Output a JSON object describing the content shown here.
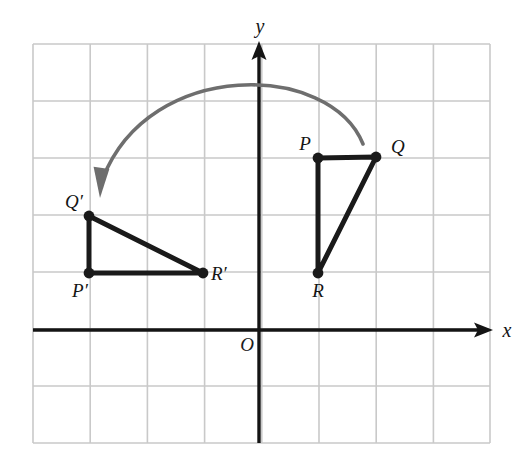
{
  "figure": {
    "background_color": "#ffffff"
  },
  "grid": {
    "color": "#c9c9c9",
    "line_width": 1.6,
    "left": 33,
    "top": 44,
    "right": 490,
    "bottom": 443,
    "cell_width": 57.2,
    "cell_height": 57.0,
    "columns": 8,
    "rows": 7,
    "x_lines": [
      33,
      90.2,
      147.4,
      204.6,
      261.8,
      319,
      376.2,
      433.4,
      490
    ],
    "y_lines": [
      44,
      101,
      158,
      215,
      272,
      329,
      386,
      443
    ]
  },
  "axes": {
    "color": "#141414",
    "line_width": 3.4,
    "origin": {
      "x": 259,
      "y": 330,
      "label": "O",
      "label_x": 247,
      "label_y": 351
    },
    "x_axis": {
      "label": "x",
      "label_x": 507,
      "label_y": 337,
      "y": 330,
      "start_x": 33,
      "end_x": 493,
      "arrow": "right-arrowhead"
    },
    "y_axis": {
      "label": "y",
      "label_x": 260,
      "label_y": 33,
      "x": 259,
      "start_y": 443,
      "end_y": 41,
      "arrow": "up-arrowhead"
    }
  },
  "shapes": {
    "stroke_color": "#1a1a1a",
    "stroke_width": 5,
    "vertex_radius": 5.4,
    "triangles": [
      {
        "name": "triangle-pqr",
        "id": "PQR",
        "vertices": [
          {
            "label": "P",
            "px": 318,
            "py": 158,
            "gx": 1,
            "gy": 3,
            "label_x": 305,
            "label_y": 150,
            "anchor": "middle"
          },
          {
            "label": "Q",
            "px": 376,
            "py": 157,
            "gx": 2,
            "gy": 3,
            "label_x": 391,
            "label_y": 153,
            "anchor": "start"
          },
          {
            "label": "R",
            "px": 318,
            "py": 273,
            "gx": 1,
            "gy": 1,
            "label_x": 318,
            "label_y": 297,
            "anchor": "middle"
          }
        ]
      },
      {
        "name": "triangle-p-prime-q-prime-r-prime",
        "id": "P'Q'R'",
        "vertices": [
          {
            "label": "Q′",
            "px": 89,
            "py": 216,
            "gx": -3,
            "gy": 2,
            "label_x": 83,
            "label_y": 208,
            "anchor": "end"
          },
          {
            "label": "P′",
            "px": 89,
            "py": 273,
            "gx": -3,
            "gy": 1,
            "label_x": 80,
            "label_y": 297,
            "anchor": "middle"
          },
          {
            "label": "R′",
            "px": 203,
            "py": 273,
            "gx": -1,
            "gy": 1,
            "label_x": 211,
            "label_y": 280,
            "anchor": "start"
          }
        ]
      }
    ]
  },
  "rotation_arrow": {
    "name": "rotation-arrow",
    "color": "#6e6e6e",
    "line_width": 3.6,
    "start": {
      "x": 363,
      "y": 144
    },
    "control_1": {
      "x": 330,
      "y": 62
    },
    "control_2": {
      "x": 150,
      "y": 58
    },
    "end": {
      "x": 103,
      "y": 178
    },
    "arrowhead_tip": {
      "x": 100,
      "y": 198
    },
    "direction": "counterclockwise-left"
  }
}
